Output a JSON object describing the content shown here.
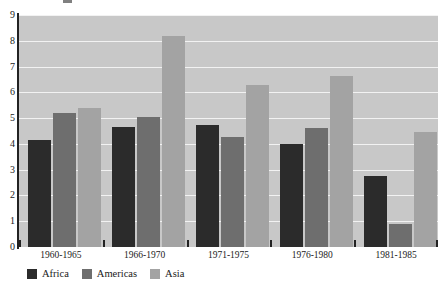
{
  "chart_data": {
    "type": "bar",
    "title": "",
    "subtitle": "",
    "xlabel": "",
    "ylabel": "",
    "categories": [
      "1960-1965",
      "1966-1970",
      "1971-1975",
      "1976-1980",
      "1981-1985"
    ],
    "series": [
      {
        "name": "Africa",
        "color": "#2b2b2b",
        "values": [
          4.15,
          4.65,
          4.75,
          4.0,
          2.75
        ]
      },
      {
        "name": "Americas",
        "color": "#6e6e6e",
        "values": [
          5.2,
          5.05,
          4.25,
          4.6,
          0.9
        ]
      },
      {
        "name": "Asia",
        "color": "#a3a3a3",
        "values": [
          5.4,
          8.2,
          6.3,
          6.65,
          4.45
        ]
      }
    ],
    "ylim": [
      0,
      9
    ],
    "yticks": [
      0,
      1,
      2,
      3,
      4,
      5,
      6,
      7,
      8,
      9
    ],
    "ytick_labels": [
      "0",
      "1",
      "2",
      "3",
      "4",
      "5",
      "6",
      "7",
      "8",
      "9"
    ],
    "grid": true,
    "gridline_color": "#f2f2f2",
    "plot_background": "#c8c8c8",
    "figure_background": "#ffffff",
    "legend_position": "bottom-left",
    "legend_entries": [
      "Africa",
      "Americas",
      "Asia"
    ]
  }
}
